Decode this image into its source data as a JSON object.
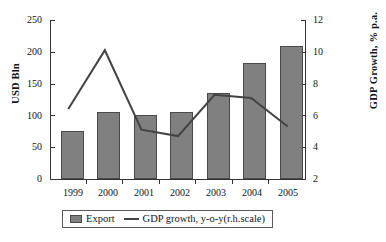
{
  "chart_data": {
    "type": "bar",
    "title": "",
    "subtitle": "",
    "categories": [
      "1999",
      "2000",
      "2001",
      "2002",
      "2003",
      "2004",
      "2005"
    ],
    "xlabel": "",
    "grid": false,
    "legend_position": "bottom",
    "series": [
      {
        "name": "Export",
        "type": "bar",
        "axis": "left",
        "color": "#808080",
        "edge_color": "#4a4a4a",
        "unit": "USD Bln",
        "values": [
          75,
          105,
          101,
          106,
          135,
          182,
          209
        ]
      },
      {
        "name": "GDP growth, y-o-y(r.h.scale)",
        "type": "line",
        "axis": "right",
        "color": "#434343",
        "unit": "% p.a.",
        "values": [
          6.4,
          10.1,
          5.1,
          4.7,
          7.3,
          7.1,
          5.3
        ]
      }
    ],
    "left_axis": {
      "label": "USD Bln",
      "ylim": [
        0,
        250
      ],
      "ticks": [
        0,
        50,
        100,
        150,
        200,
        250
      ],
      "tick_labels": [
        "0",
        "50",
        "100",
        "150",
        "200",
        "250"
      ]
    },
    "right_axis": {
      "label": "GDP Growth, % p.a.",
      "ylim": [
        2,
        12
      ],
      "ticks": [
        2,
        4,
        6,
        8,
        10,
        12
      ],
      "tick_labels": [
        "2",
        "4",
        "6",
        "8",
        "10",
        "12"
      ]
    }
  },
  "legend": {
    "items": [
      {
        "label": "Export",
        "marker": "bar-swatch-icon"
      },
      {
        "label": "GDP growth, y-o-y(r.h.scale)",
        "marker": "line-swatch-icon"
      }
    ]
  }
}
